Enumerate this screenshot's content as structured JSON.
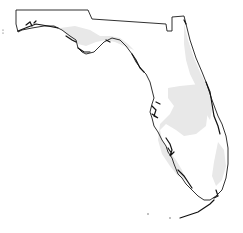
{
  "map": {
    "region": "Florida",
    "background": "#ffffff",
    "outline_color": "#1a1a1a",
    "shade_color": "#e8e8e8",
    "shaded_regions": [
      "north-atlantic-coast-band",
      "central-florida-band",
      "southwest-gulf-band",
      "southeast-band",
      "panhandle-gulf-band"
    ]
  }
}
